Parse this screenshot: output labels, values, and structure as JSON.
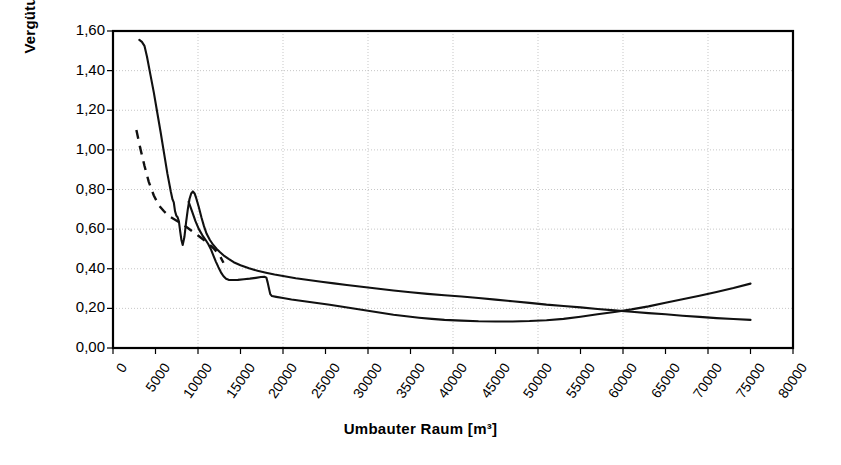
{
  "chart_data": {
    "type": "line",
    "title": "",
    "xlabel": "Umbauter Raum [m³]",
    "ylabel": "Vergütung [Prozent]",
    "xlim": [
      0,
      80000
    ],
    "ylim": [
      0,
      1.6
    ],
    "xticks": [
      "0",
      "5000",
      "10000",
      "15000",
      "20000",
      "25000",
      "30000",
      "35000",
      "40000",
      "45000",
      "50000",
      "55000",
      "60000",
      "65000",
      "70000",
      "75000",
      "80000"
    ],
    "ytick_labels": [
      "0,00",
      "0,20",
      "0,40",
      "0,60",
      "0,80",
      "1,00",
      "1,20",
      "1,40",
      "1,60"
    ],
    "ytick_values": [
      0.0,
      0.2,
      0.4,
      0.6,
      0.8,
      1.0,
      1.2,
      1.4,
      1.6
    ],
    "grid": true,
    "grid_x_interval": 10000,
    "grid_y_interval": 0.2,
    "legend": "none",
    "series": [
      {
        "name": "upper-solid-curve",
        "style": "solid",
        "points": [
          [
            3100,
            1.555
          ],
          [
            3400,
            1.545
          ],
          [
            3700,
            1.525
          ],
          [
            4000,
            1.47
          ],
          [
            4400,
            1.38
          ],
          [
            4800,
            1.29
          ],
          [
            5200,
            1.19
          ],
          [
            5600,
            1.09
          ],
          [
            6000,
            0.985
          ],
          [
            6400,
            0.88
          ],
          [
            6800,
            0.79
          ],
          [
            7000,
            0.75
          ],
          [
            7150,
            0.735
          ],
          [
            7300,
            0.69
          ],
          [
            7450,
            0.668
          ],
          [
            7600,
            0.66
          ],
          [
            7750,
            0.64
          ],
          [
            7900,
            0.59
          ],
          [
            8050,
            0.545
          ],
          [
            8200,
            0.52
          ],
          [
            8400,
            0.56
          ],
          [
            8600,
            0.635
          ],
          [
            8800,
            0.7
          ],
          [
            9000,
            0.752
          ],
          [
            9200,
            0.78
          ],
          [
            9400,
            0.79
          ],
          [
            9600,
            0.78
          ],
          [
            9800,
            0.755
          ],
          [
            10100,
            0.71
          ],
          [
            10400,
            0.66
          ],
          [
            10700,
            0.615
          ],
          [
            11000,
            0.578
          ],
          [
            11400,
            0.545
          ],
          [
            11800,
            0.52
          ],
          [
            12200,
            0.5
          ],
          [
            12600,
            0.483
          ],
          [
            13000,
            0.468
          ],
          [
            13600,
            0.45
          ],
          [
            14200,
            0.433
          ],
          [
            15000,
            0.418
          ],
          [
            16000,
            0.402
          ],
          [
            17000,
            0.39
          ],
          [
            18000,
            0.38
          ],
          [
            19000,
            0.371
          ],
          [
            20000,
            0.363
          ],
          [
            21500,
            0.352
          ],
          [
            23000,
            0.343
          ],
          [
            24500,
            0.334
          ],
          [
            26000,
            0.326
          ],
          [
            27500,
            0.318
          ],
          [
            29000,
            0.31
          ],
          [
            31000,
            0.3
          ],
          [
            33000,
            0.29
          ],
          [
            35000,
            0.281
          ],
          [
            37000,
            0.273
          ],
          [
            39000,
            0.266
          ],
          [
            41000,
            0.26
          ],
          [
            43000,
            0.252
          ],
          [
            45000,
            0.244
          ],
          [
            47000,
            0.236
          ],
          [
            49000,
            0.228
          ],
          [
            51000,
            0.219
          ],
          [
            53000,
            0.212
          ],
          [
            55000,
            0.205
          ],
          [
            57000,
            0.197
          ],
          [
            59000,
            0.19
          ],
          [
            61000,
            0.183
          ],
          [
            63000,
            0.176
          ],
          [
            65000,
            0.17
          ],
          [
            67000,
            0.163
          ],
          [
            69000,
            0.157
          ],
          [
            71000,
            0.151
          ],
          [
            73000,
            0.146
          ],
          [
            75000,
            0.142
          ]
        ]
      },
      {
        "name": "lower-solid-curve",
        "style": "solid",
        "points": [
          [
            8900,
            0.738
          ],
          [
            9300,
            0.69
          ],
          [
            9700,
            0.64
          ],
          [
            10100,
            0.6
          ],
          [
            10500,
            0.57
          ],
          [
            10900,
            0.545
          ],
          [
            11200,
            0.525
          ],
          [
            11500,
            0.5
          ],
          [
            11800,
            0.468
          ],
          [
            12100,
            0.436
          ],
          [
            12400,
            0.408
          ],
          [
            12700,
            0.382
          ],
          [
            13000,
            0.362
          ],
          [
            13300,
            0.349
          ],
          [
            13600,
            0.344
          ],
          [
            14100,
            0.343
          ],
          [
            14700,
            0.344
          ],
          [
            15400,
            0.347
          ],
          [
            16100,
            0.35
          ],
          [
            16800,
            0.354
          ],
          [
            17400,
            0.358
          ],
          [
            17800,
            0.36
          ],
          [
            18050,
            0.355
          ],
          [
            18200,
            0.33
          ],
          [
            18350,
            0.3
          ],
          [
            18500,
            0.272
          ],
          [
            18700,
            0.262
          ],
          [
            19200,
            0.258
          ],
          [
            20000,
            0.252
          ],
          [
            21000,
            0.245
          ],
          [
            22500,
            0.236
          ],
          [
            24000,
            0.227
          ],
          [
            25500,
            0.218
          ],
          [
            27000,
            0.208
          ],
          [
            28500,
            0.198
          ],
          [
            30000,
            0.188
          ],
          [
            31500,
            0.178
          ],
          [
            33000,
            0.168
          ],
          [
            34500,
            0.16
          ],
          [
            36000,
            0.153
          ],
          [
            37500,
            0.147
          ],
          [
            39000,
            0.142
          ],
          [
            41000,
            0.138
          ],
          [
            43000,
            0.135
          ],
          [
            45000,
            0.134
          ],
          [
            47000,
            0.134
          ],
          [
            49000,
            0.136
          ],
          [
            51000,
            0.14
          ],
          [
            53000,
            0.147
          ],
          [
            55000,
            0.158
          ],
          [
            57000,
            0.17
          ],
          [
            59000,
            0.182
          ],
          [
            61000,
            0.195
          ],
          [
            63000,
            0.21
          ],
          [
            65000,
            0.228
          ],
          [
            67000,
            0.246
          ],
          [
            69000,
            0.264
          ],
          [
            71000,
            0.283
          ],
          [
            73000,
            0.303
          ],
          [
            75000,
            0.325
          ]
        ]
      },
      {
        "name": "dashed-curve",
        "style": "dashed",
        "points": [
          [
            2750,
            1.1
          ],
          [
            3200,
            1.01
          ],
          [
            3700,
            0.92
          ],
          [
            4200,
            0.84
          ],
          [
            4800,
            0.77
          ],
          [
            5400,
            0.72
          ],
          [
            6000,
            0.69
          ],
          [
            6600,
            0.665
          ],
          [
            7200,
            0.65
          ],
          [
            7900,
            0.632
          ],
          [
            8600,
            0.612
          ],
          [
            9300,
            0.59
          ],
          [
            10000,
            0.568
          ],
          [
            10700,
            0.545
          ],
          [
            11300,
            0.524
          ],
          [
            11900,
            0.5
          ],
          [
            12300,
            0.48
          ],
          [
            12700,
            0.455
          ],
          [
            13000,
            0.43
          ]
        ]
      }
    ]
  },
  "axis": {
    "x_title": "Umbauter Raum [m³]",
    "y_title": "Vergütung [Prozent]"
  }
}
